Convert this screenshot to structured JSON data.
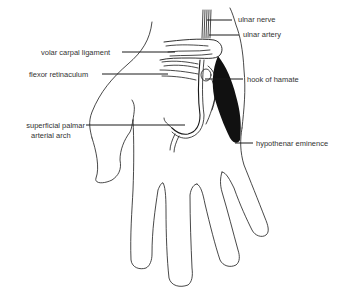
{
  "diagram": {
    "colors": {
      "ink": "#1a1a1a",
      "label_text": "#333333",
      "background": "#ffffff"
    },
    "labels": [
      {
        "id": "ulnar-nerve",
        "text": "ulnar nerve",
        "side": "right"
      },
      {
        "id": "ulnar-artery",
        "text": "ulnar artery",
        "side": "right"
      },
      {
        "id": "volar-carpal-ligament",
        "text": "volar carpal ligament",
        "side": "left"
      },
      {
        "id": "flexor-retinaculum",
        "text": "flexor retinaculum",
        "side": "left"
      },
      {
        "id": "hook-of-hamate",
        "text": "hook of hamate",
        "side": "right"
      },
      {
        "id": "superficial-palmar-arterial-arch-line1",
        "text": "superficial palmar",
        "side": "left"
      },
      {
        "id": "superficial-palmar-arterial-arch-line2",
        "text": "arterial arch",
        "side": "left"
      },
      {
        "id": "hypothenar-eminence",
        "text": "hypothenar eminence",
        "side": "right"
      }
    ]
  }
}
